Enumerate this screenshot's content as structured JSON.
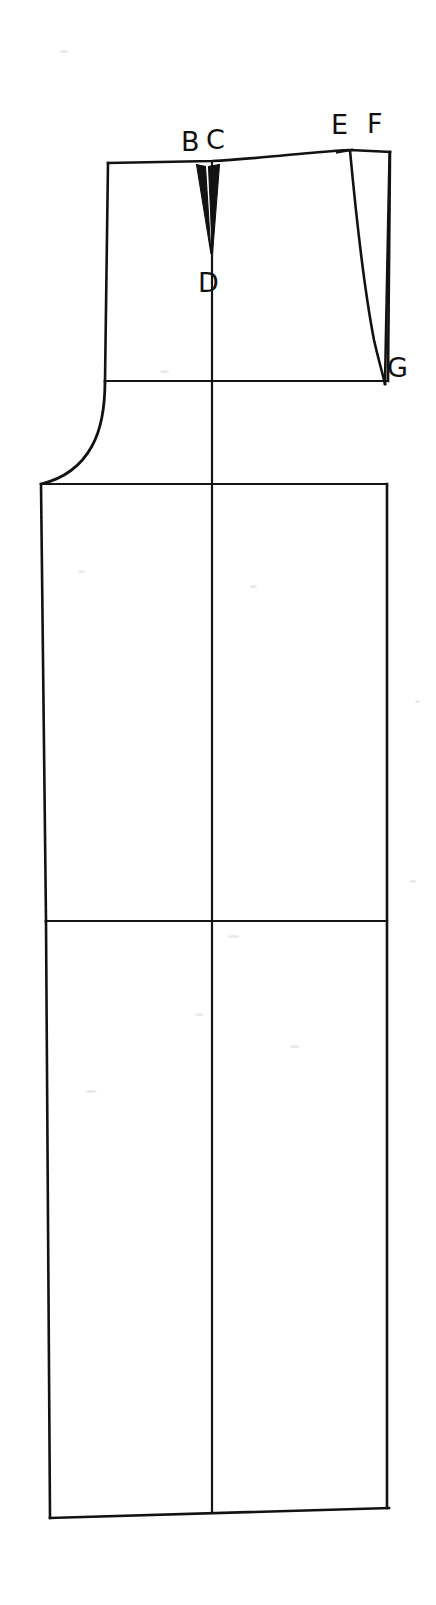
{
  "figure": {
    "kind": "garment-pattern-draft",
    "background_color": "#ffffff",
    "line_color": "#121212",
    "canvas": {
      "width": 436,
      "height": 1605
    }
  },
  "labels": [
    {
      "id": "B",
      "text": "B",
      "x": 181,
      "y": 128
    },
    {
      "id": "C",
      "text": "C",
      "x": 206,
      "y": 126
    },
    {
      "id": "D",
      "text": "D",
      "x": 198,
      "y": 269
    },
    {
      "id": "E",
      "text": "E",
      "x": 331,
      "y": 111
    },
    {
      "id": "F",
      "text": "F",
      "x": 367,
      "y": 110
    },
    {
      "id": "G",
      "text": "G",
      "x": 387,
      "y": 354
    }
  ],
  "geometry": {
    "waistline": "M108,163 L212,161 C260,158 310,152 350,150 L390,152",
    "left_upper_edge": "M108,163 L105,381",
    "right_upper_edge": "M390,152 L388,381",
    "hip_line": "M105,381 L388,381",
    "side_curve": "M105,381 C105,430 78,470 41,484",
    "crotch_line": "M41,484 L387,484",
    "left_lower_edge": "M41,484 L46,921",
    "knee_line": "M46,921 L387,921",
    "left_hem_edge": "M46,921 L50,1518",
    "right_lower_edge": "M387,484 L387,1508",
    "hem_line": "M50,1518 L389,1508",
    "center_line": "M212,161 L212,1513",
    "dart_left": "M196,164 L206,167 L211,255 Z",
    "dart_right": "M209,166 L219,164 L212,255 Z",
    "side_dart": "M350,150 C357,250 368,330 384,385 L389,153 Z"
  },
  "notes": {
    "point_count": 6,
    "dart_count": 3,
    "horizontal_construction_lines": 4
  }
}
